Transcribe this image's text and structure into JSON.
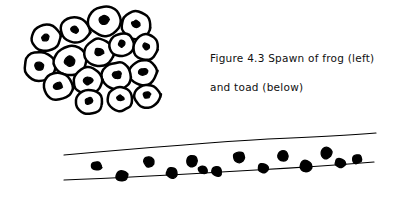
{
  "figure": {
    "caption_line_1": "Figure 4.3  Spawn of frog (left)",
    "caption_line_2": "and toad (below)",
    "label": "Figure 4.3",
    "subject_left": "Spawn of frog (left)",
    "subject_below": "and toad (below)"
  },
  "colors": {
    "ink": "#000000",
    "background": "#ffffff",
    "embryo": "#000000",
    "egg_fill": "#ffffff"
  },
  "frog_spawn": {
    "name": "frog-spawn-clump",
    "description": "Clumped mass of round eggs, each with a dark embryo",
    "egg_count": 16,
    "eggs": [
      {
        "cx": 46,
        "cy": 38,
        "rx": 15,
        "ry": 13,
        "rot": -12,
        "ecx": 45,
        "ecy": 38,
        "er": 4.0
      },
      {
        "cx": 75,
        "cy": 30,
        "rx": 15,
        "ry": 13,
        "rot": 8,
        "ecx": 75,
        "ecy": 30,
        "er": 4.2
      },
      {
        "cx": 105,
        "cy": 21,
        "rx": 17,
        "ry": 15,
        "rot": -4,
        "ecx": 104,
        "ecy": 20,
        "er": 4.8
      },
      {
        "cx": 136,
        "cy": 25,
        "rx": 15,
        "ry": 14,
        "rot": 10,
        "ecx": 136,
        "ecy": 24,
        "er": 4.2
      },
      {
        "cx": 40,
        "cy": 66,
        "rx": 16,
        "ry": 15,
        "rot": 5,
        "ecx": 39,
        "ecy": 66,
        "er": 5.0
      },
      {
        "cx": 70,
        "cy": 61,
        "rx": 17,
        "ry": 15,
        "rot": -8,
        "ecx": 70,
        "ecy": 61,
        "er": 5.4
      },
      {
        "cx": 99,
        "cy": 53,
        "rx": 15,
        "ry": 14,
        "rot": 6,
        "ecx": 99,
        "ecy": 52,
        "er": 4.4
      },
      {
        "cx": 122,
        "cy": 45,
        "rx": 13,
        "ry": 12,
        "rot": -6,
        "ecx": 122,
        "ecy": 44,
        "er": 3.6
      },
      {
        "cx": 146,
        "cy": 47,
        "rx": 13,
        "ry": 13,
        "rot": 12,
        "ecx": 146,
        "ecy": 46,
        "er": 3.8
      },
      {
        "cx": 143,
        "cy": 73,
        "rx": 14,
        "ry": 13,
        "rot": -9,
        "ecx": 143,
        "ecy": 72,
        "er": 4.0
      },
      {
        "cx": 117,
        "cy": 76,
        "rx": 15,
        "ry": 14,
        "rot": 4,
        "ecx": 117,
        "ecy": 75,
        "er": 4.4
      },
      {
        "cx": 88,
        "cy": 81,
        "rx": 15,
        "ry": 14,
        "rot": -5,
        "ecx": 88,
        "ecy": 81,
        "er": 4.4
      },
      {
        "cx": 58,
        "cy": 86,
        "rx": 15,
        "ry": 14,
        "rot": 7,
        "ecx": 58,
        "ecy": 86,
        "er": 4.4
      },
      {
        "cx": 89,
        "cy": 102,
        "rx": 14,
        "ry": 12,
        "rot": -3,
        "ecx": 89,
        "ecy": 101,
        "er": 4.0
      },
      {
        "cx": 120,
        "cy": 99,
        "rx": 13,
        "ry": 12,
        "rot": 9,
        "ecx": 120,
        "ecy": 98,
        "er": 3.8
      },
      {
        "cx": 147,
        "cy": 96,
        "rx": 13,
        "ry": 12,
        "rot": -7,
        "ecx": 147,
        "ecy": 95,
        "er": 3.8
      }
    ]
  },
  "toad_spawn": {
    "name": "toad-spawn-string",
    "description": "Long gelatinous ribbon containing a row of dark eggs",
    "egg_count": 14,
    "top_edge": "M 64,155 C 120,150 200,143 268,139 C 316,137 352,135 376,133",
    "bottom_edge": "M 64,180 C 120,178 190,174 256,170 C 310,167 350,164 374,162",
    "eggs": [
      {
        "cx": 96,
        "cy": 166,
        "r": 5.2,
        "rot": 14
      },
      {
        "cx": 122,
        "cy": 176,
        "r": 6.0,
        "rot": -20
      },
      {
        "cx": 149,
        "cy": 162,
        "r": 5.6,
        "rot": 5
      },
      {
        "cx": 172,
        "cy": 173,
        "r": 5.8,
        "rot": 22
      },
      {
        "cx": 192,
        "cy": 161,
        "r": 6.0,
        "rot": -10
      },
      {
        "cx": 217,
        "cy": 172,
        "r": 5.4,
        "rot": 16
      },
      {
        "cx": 239,
        "cy": 157,
        "r": 6.2,
        "rot": -6
      },
      {
        "cx": 263,
        "cy": 168,
        "r": 5.6,
        "rot": 12
      },
      {
        "cx": 283,
        "cy": 156,
        "r": 5.8,
        "rot": -14
      },
      {
        "cx": 306,
        "cy": 166,
        "r": 6.4,
        "rot": 8
      },
      {
        "cx": 326,
        "cy": 153,
        "r": 6.0,
        "rot": -18
      },
      {
        "cx": 340,
        "cy": 163,
        "r": 5.2,
        "rot": 10
      },
      {
        "cx": 357,
        "cy": 159,
        "r": 5.0,
        "rot": -8
      },
      {
        "cx": 203,
        "cy": 170,
        "r": 4.6,
        "rot": 25
      }
    ]
  }
}
